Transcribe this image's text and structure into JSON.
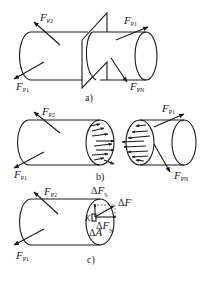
{
  "figure": {
    "parts": [
      {
        "caption": "a)",
        "labels": {
          "fp2": {
            "main": "F",
            "sub": "P2"
          },
          "fp1_right": {
            "main": "F",
            "sub": "P1"
          },
          "fp1_left": {
            "main": "F",
            "sub": "P1"
          },
          "fpn": {
            "main": "F",
            "sub": "PN"
          }
        }
      },
      {
        "caption": "b)",
        "labels": {
          "fp2": {
            "main": "F",
            "sub": "P2"
          },
          "fp1_right": {
            "main": "F",
            "sub": "P1"
          },
          "fp1_left": {
            "main": "F",
            "sub": "P1"
          },
          "fpn": {
            "main": "F",
            "sub": "PN"
          }
        }
      },
      {
        "caption": "c)",
        "labels": {
          "fp2": {
            "main": "F",
            "sub": "P2"
          },
          "fp1_left": {
            "main": "F",
            "sub": "P1"
          },
          "dfs": {
            "delta": "Δ",
            "main": "F",
            "sub": "S"
          },
          "df": {
            "delta": "Δ",
            "main": "F"
          },
          "dfn": {
            "delta": "Δ",
            "main": "F",
            "sub": "N"
          },
          "da": {
            "delta": "Δ",
            "main": "A"
          },
          "k": {
            "main": "K"
          }
        }
      }
    ]
  }
}
